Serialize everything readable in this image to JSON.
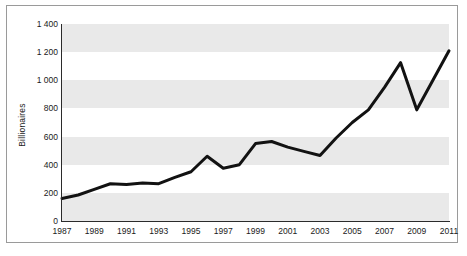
{
  "chart_data": {
    "type": "line",
    "title": "",
    "xlabel": "",
    "ylabel": "Billionaires",
    "xlim": [
      1987,
      2011
    ],
    "ylim": [
      0,
      1400
    ],
    "grid": false,
    "banded_background": true,
    "legend": "none",
    "y_ticks": [
      "0",
      "200",
      "400",
      "600",
      "800",
      "1 000",
      "1 200",
      "1 400"
    ],
    "y_tick_values": [
      0,
      200,
      400,
      600,
      800,
      1000,
      1200,
      1400
    ],
    "x_ticks": [
      "1987",
      "1989",
      "1991",
      "1993",
      "1995",
      "1997",
      "1999",
      "2001",
      "2003",
      "2005",
      "2007",
      "2009",
      "2011"
    ],
    "x_tick_values": [
      1987,
      1989,
      1991,
      1993,
      1995,
      1997,
      1999,
      2001,
      2003,
      2005,
      2007,
      2009,
      2011
    ],
    "x": [
      1987,
      1988,
      1989,
      1990,
      1991,
      1992,
      1993,
      1994,
      1995,
      1996,
      1997,
      1998,
      1999,
      2000,
      2001,
      2002,
      2003,
      2004,
      2005,
      2006,
      2007,
      2008,
      2009,
      2010,
      2011
    ],
    "values": [
      160,
      185,
      225,
      265,
      260,
      270,
      265,
      310,
      350,
      460,
      375,
      400,
      550,
      565,
      525,
      495,
      465,
      590,
      700,
      790,
      950,
      1125,
      790,
      1000,
      1210
    ],
    "series": [
      {
        "name": "Billionaires",
        "color": "#121212",
        "values": [
          160,
          185,
          225,
          265,
          260,
          270,
          265,
          310,
          350,
          460,
          375,
          400,
          550,
          565,
          525,
          495,
          465,
          590,
          700,
          790,
          950,
          1125,
          790,
          1000,
          1210
        ]
      }
    ],
    "colors": {
      "line": "#121212",
      "band": "#e9e9e9",
      "axis": "#2b2b2b",
      "border": "#9a9a9a",
      "text": "#1a1a1a",
      "background": "#ffffff"
    }
  }
}
